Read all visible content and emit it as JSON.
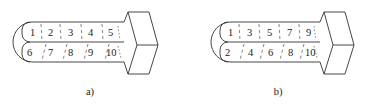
{
  "figure": {
    "panels": [
      {
        "id": "a",
        "caption": "a)",
        "top_row": [
          "1",
          "2",
          "3",
          "4",
          "5"
        ],
        "bottom_row": [
          "6",
          "7",
          "8",
          "9",
          "10"
        ],
        "ordering": "sequential: top row 1–5, bottom row 6–10"
      },
      {
        "id": "b",
        "caption": "b)",
        "top_row": [
          "1",
          "3",
          "5",
          "7",
          "9"
        ],
        "bottom_row": [
          "2",
          "4",
          "6",
          "8",
          "10"
        ],
        "ordering": "alternating: odd numbers on top row, even on bottom row"
      }
    ]
  },
  "colors": {
    "line": "#333333",
    "text": "#222222",
    "background": "#ffffff"
  }
}
